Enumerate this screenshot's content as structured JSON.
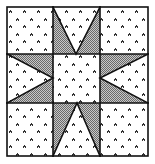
{
  "figure": {
    "title": "",
    "colors": {
      "background": "#ffffff",
      "line": "#111111",
      "shade": "#9a9a9a",
      "dot": "#333333"
    },
    "block": {
      "x0": 7,
      "y0": 7,
      "x1": 148,
      "y1": 156
    },
    "grid": {
      "vx": [
        53,
        100
      ],
      "hy": [
        54,
        103
      ]
    },
    "star_tips": {
      "top": [
        76,
        54
      ],
      "bottom": [
        77,
        103
      ],
      "left": [
        53,
        78
      ],
      "right": [
        100,
        78
      ]
    }
  }
}
